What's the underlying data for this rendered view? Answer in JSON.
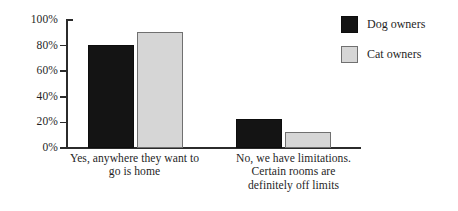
{
  "chart_data": {
    "type": "bar",
    "title": "",
    "subtitle": "",
    "xlabel": "",
    "ylabel": "",
    "ylim": [
      0,
      100
    ],
    "grid": false,
    "legend_position": "top-right",
    "categories": [
      "Yes, anywhere they want to go is home",
      "No, we have limitations. Certain rooms are definitely off limits"
    ],
    "category_lines": [
      [
        "Yes, anywhere they want to",
        "go is home"
      ],
      [
        "No, we have limitations.",
        "Certain rooms are",
        "definitely off limits"
      ]
    ],
    "series": [
      {
        "name": "Dog owners",
        "color": "#141414",
        "values": [
          79,
          21
        ]
      },
      {
        "name": "Cat owners",
        "color": "#d6d6d6",
        "values": [
          89,
          11
        ]
      }
    ],
    "y_ticks": [
      {
        "value": 100,
        "label": "100%"
      },
      {
        "value": 80,
        "label": "80%"
      },
      {
        "value": 60,
        "label": "60%"
      },
      {
        "value": 40,
        "label": "40%"
      },
      {
        "value": 20,
        "label": "20%"
      },
      {
        "value": 0,
        "label": "0%"
      }
    ]
  },
  "legend": {
    "items": [
      {
        "label": "Dog owners",
        "swatch": "dog"
      },
      {
        "label": "Cat owners",
        "swatch": "cat"
      }
    ]
  },
  "colors": {
    "dog_fill": "#141414",
    "cat_fill": "#d6d6d6",
    "cat_border": "#707070",
    "axis": "#2b2b2b",
    "text": "#1f1f1f",
    "background": "#ffffff"
  }
}
